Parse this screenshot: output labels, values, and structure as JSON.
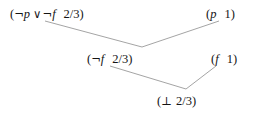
{
  "diagram": {
    "kind": "resolution-derivation-tree",
    "background_color": "#ffffff",
    "edge_color": "#9a9a9a",
    "text_color": "#141414",
    "nodes": [
      {
        "id": "top-left",
        "open_paren": "(",
        "negation": "¬",
        "atom_1": "p",
        "operator": "∨",
        "negation_2": "¬",
        "atom_2": "f",
        "weight": "2/3",
        "close_paren": ")",
        "full_text": "(¬p ∨ ¬f   2/3)"
      },
      {
        "id": "top-right",
        "open_paren": "(",
        "atom": "p",
        "weight": "1",
        "close_paren": ")",
        "full_text": "(p   1)"
      },
      {
        "id": "mid-left",
        "open_paren": "(",
        "negation": "¬",
        "atom": "f",
        "weight": "2/3",
        "close_paren": ")",
        "full_text": "(¬f   2/3)"
      },
      {
        "id": "mid-right",
        "open_paren": "(",
        "atom": "f",
        "weight": "1",
        "close_paren": ")",
        "full_text": "(f   1)"
      },
      {
        "id": "bottom",
        "open_paren": "(",
        "symbol": "⊥",
        "weight": "2/3",
        "close_paren": ")",
        "full_text": "(⊥ 2/3)"
      }
    ],
    "edges": [
      {
        "id": "edge-top-left-to-mid",
        "from": "top-left",
        "to": "mid-left",
        "x1": 45,
        "y1": 21,
        "x2": 142,
        "y2": 47
      },
      {
        "id": "edge-top-right-to-mid",
        "from": "top-right",
        "to": "mid-left",
        "x1": 142,
        "y1": 47,
        "x2": 219,
        "y2": 21
      },
      {
        "id": "edge-mid-left-to-bottom",
        "from": "mid-left",
        "to": "bottom",
        "x1": 110,
        "y1": 66,
        "x2": 186,
        "y2": 89
      },
      {
        "id": "edge-mid-right-to-bottom",
        "from": "mid-right",
        "to": "bottom",
        "x1": 186,
        "y1": 89,
        "x2": 216,
        "y2": 66
      }
    ]
  }
}
